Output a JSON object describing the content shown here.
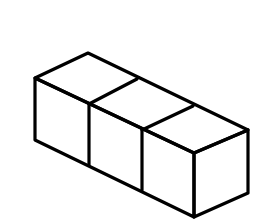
{
  "figure": {
    "cube_count": 3,
    "stroke_color": "#000000",
    "background_color": "#ffffff",
    "stroke_width": 3.2
  },
  "geometry": {
    "top_face": "88,53 35,78 194,153 248,130",
    "front_face": "35,78 194,153 194,217 35,140",
    "right_face": "194,153 248,130 248,193 194,217",
    "top_dividers": [
      {
        "x1": 137,
        "y1": 79,
        "x2": 89,
        "y2": 104
      },
      {
        "x1": 193,
        "y1": 106,
        "x2": 142,
        "y2": 130
      }
    ],
    "front_dividers": [
      {
        "x1": 89,
        "y1": 104,
        "x2": 89,
        "y2": 165
      },
      {
        "x1": 142,
        "y1": 130,
        "x2": 142,
        "y2": 190
      }
    ]
  }
}
